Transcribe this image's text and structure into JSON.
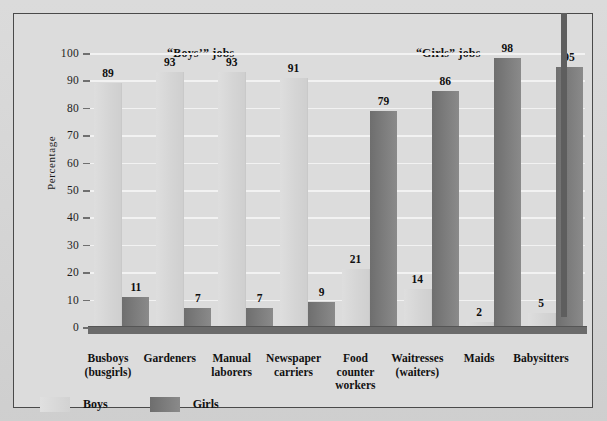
{
  "chart_data": {
    "type": "bar",
    "title": "",
    "xlabel": "",
    "ylabel": "Percentage",
    "ylim": [
      0,
      100
    ],
    "ytick_step": 10,
    "yticks": [
      0,
      10,
      20,
      30,
      40,
      50,
      60,
      70,
      80,
      90,
      100
    ],
    "grid": true,
    "legend_position": "bottom-left",
    "categories": [
      "Busboys (busgirls)",
      "Gardeners",
      "Manual laborers",
      "Newspaper carriers",
      "Food counter workers",
      "Waitresses (waiters)",
      "Maids",
      "Babysitters"
    ],
    "category_lines": [
      [
        "Busboys",
        "(busgirls)"
      ],
      [
        "Gardeners"
      ],
      [
        "Manual",
        "laborers"
      ],
      [
        "Newspaper",
        "carriers"
      ],
      [
        "Food",
        "counter",
        "workers"
      ],
      [
        "Waitresses",
        "(waiters)"
      ],
      [
        "Maids"
      ],
      [
        "Babysitters"
      ]
    ],
    "series": [
      {
        "name": "Boys",
        "color": "#d6d6d6",
        "values": [
          89,
          93,
          93,
          91,
          21,
          14,
          2,
          5
        ]
      },
      {
        "name": "Girls",
        "color": "#7a7a7a",
        "values": [
          11,
          7,
          7,
          9,
          79,
          86,
          98,
          95
        ]
      }
    ],
    "group_headers": [
      {
        "label": "“Boys’” jobs",
        "spans_categories": [
          0,
          3
        ]
      },
      {
        "label": "“Girls” jobs",
        "spans_categories": [
          4,
          7
        ]
      }
    ],
    "annotations": []
  },
  "legend": {
    "items": [
      {
        "label": "Boys",
        "color": "#d6d6d6"
      },
      {
        "label": "Girls",
        "color": "#7a7a7a"
      }
    ]
  },
  "colors": {
    "background": "#d7d7d7",
    "panel": "#dcdcdc",
    "frame": "#4a4a4a",
    "gridline": "#f2f2f2",
    "baseline": "#6b6b6b",
    "boys_bar": "#d6d6d6",
    "girls_bar": "#7a7a7a",
    "text": "#111111"
  }
}
